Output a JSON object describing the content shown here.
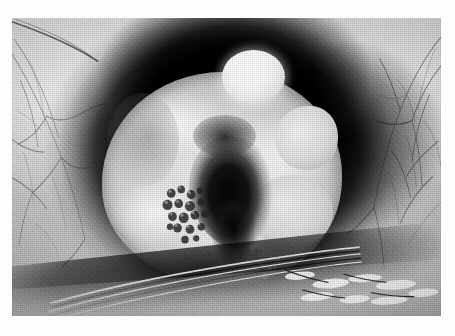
{
  "page": {
    "background_color": "#ffffff",
    "type": "printed-figure-page"
  },
  "figure": {
    "name": "clinical-eye-photograph",
    "modality": "color-film photograph reproduced as black-and-white halftone print",
    "orientation": "landscape",
    "tone": "grayscale",
    "plate": {
      "left_px": 12,
      "top_px": 18,
      "width_px": 429,
      "height_px": 298
    },
    "regions": [
      {
        "name": "conjunctiva-left",
        "label": "Nasal bulbar conjunctiva",
        "description": "Pale sclera with fine branching blood vessels",
        "tone": "light gray"
      },
      {
        "name": "conjunctiva-right",
        "label": "Temporal bulbar conjunctiva",
        "description": "Pale sclera with dense fine vascular network",
        "tone": "light gray"
      },
      {
        "name": "iris-pupil-dark-zone",
        "label": "Dark iris and pupil region",
        "description": "Broad very dark circular zone surrounding the central mass",
        "tone": "near black"
      },
      {
        "name": "corneal-mass",
        "label": "Pale lobulated mass on cornea",
        "description": "Large whitish multi-lobed elevated lesion occupying the corneal surface",
        "tone": "white to light gray"
      },
      {
        "name": "superior-nodule",
        "label": "Bright rounded superior nodule",
        "description": "Small globular outgrowth at the upper pole of the mass with specular highlight",
        "tone": "bright white"
      },
      {
        "name": "central-ulceration",
        "label": "Dark central ulcerated area",
        "description": "Irregular dark excavated centre of the lesion",
        "tone": "black"
      },
      {
        "name": "granular-cluster",
        "label": "Granular papillomatous cluster",
        "description": "Cobblestone-like grouped small nodules at the inferonasal edge of the ulcer",
        "tone": "mottled dark gray"
      },
      {
        "name": "satellite-nodules",
        "label": "Inferior satellite nodules",
        "description": "Small pale beaded nodules along the inferior limbus",
        "tone": "light gray"
      },
      {
        "name": "lower-lid-margin",
        "label": "Lower eyelid margin with lashes",
        "description": "Dark lid edge with bright specular streaks and lash clumps across the lower border",
        "tone": "dark with white highlights"
      },
      {
        "name": "upper-lid-crease",
        "label": "Upper eyelid crease",
        "description": "Dark curved skin crease crossing the upper-left corner",
        "tone": "dark gray line"
      }
    ],
    "colors": {
      "paper": "#ffffff",
      "highlight": "#ffffff",
      "midtone": "#bdbdbd",
      "shadow": "#0a0a0a",
      "plate_base": "#c2c2c2"
    }
  },
  "caption": {
    "visible": true,
    "legible": false,
    "text": "",
    "note": "Caption line is cropped off at the bottom edge of the page; only faint ascender fragments remain."
  }
}
